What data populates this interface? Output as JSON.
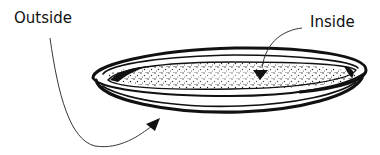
{
  "diagram": {
    "labels": {
      "outside": "Outside",
      "inside": "Inside"
    },
    "arrows": [
      {
        "from": "outside",
        "to": "dish-underside"
      },
      {
        "from": "inside",
        "to": "dish-interior"
      }
    ],
    "colors": {
      "ink": "#111111",
      "background": "#ffffff"
    }
  }
}
